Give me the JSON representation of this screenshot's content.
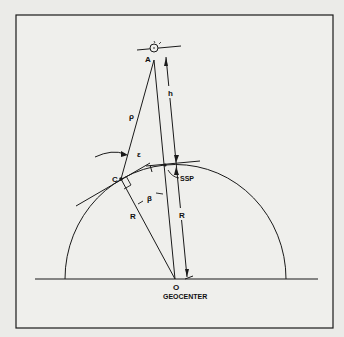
{
  "diagram": {
    "type": "geometry",
    "labels": {
      "satellite": "A",
      "rho": "ρ",
      "height": "h",
      "epsilon": "ε",
      "station": "C",
      "ssp": "SSP",
      "beta": "β",
      "radius_left": "R",
      "radius_right": "R",
      "center": "O",
      "geocenter": "GEOCENTER"
    },
    "colors": {
      "background": "#ebebe8",
      "ink": "#1a1a1a"
    }
  }
}
